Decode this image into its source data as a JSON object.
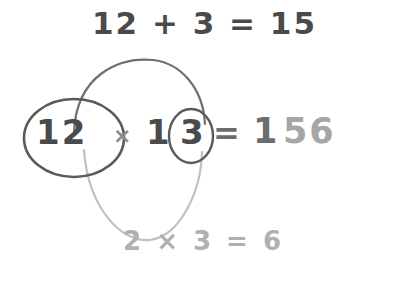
{
  "diagram": {
    "top_expression": "12 + 3 = 15",
    "main_line": {
      "left_factor": "12",
      "times_symbol": "×",
      "right_factor_tens": "1",
      "right_factor_units": "3",
      "equals_symbol": "=",
      "result_head": "1",
      "result_tail": "56"
    },
    "bottom_expression": "2 × 3 = 6",
    "colors": {
      "dark_text": "#4a4a4a",
      "mid_text": "#6d6d6d",
      "light_text": "#a6a6a6",
      "faint_text": "#b0b0b0",
      "dark_stroke": "#5a5a5a",
      "light_stroke": "#b5b5b5",
      "background": "#ffffff"
    },
    "strokes": {
      "top_arc_label": "arc-from-12-to-3-upper",
      "bottom_arc_label": "arc-from-2-to-3-lower",
      "circle_left_label": "circle-around-12",
      "circle_right_label": "circle-around-3"
    }
  }
}
